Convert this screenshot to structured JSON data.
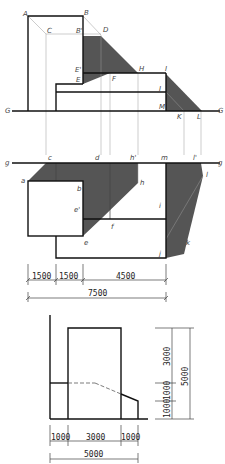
{
  "colors": {
    "shadow": "#555555",
    "line": "#111111",
    "projector": "#999999",
    "background": "#ffffff"
  },
  "elevation": {
    "ground_line_label_left": "G",
    "ground_line_label_right": "G",
    "points": {
      "A": "A",
      "B": "B",
      "C": "C",
      "B_prime": "B'",
      "D": "D",
      "E_prime": "E'",
      "E": "E",
      "F": "F",
      "H": "H",
      "I": "I",
      "J": "J",
      "M": "M",
      "K": "K",
      "L": "L"
    }
  },
  "plan": {
    "ground_line_label_left": "g",
    "ground_line_label_right": "g",
    "points": {
      "c": "c",
      "d": "d",
      "h_prime": "h'",
      "m": "m",
      "l_prime": "l'",
      "a": "a",
      "b": "b",
      "h": "h",
      "l": "l",
      "e_prime": "e'",
      "f": "f",
      "i": "i",
      "e": "e",
      "j": "j",
      "k": "k"
    }
  },
  "plan_dimensions": {
    "segments": [
      "1500",
      "1500",
      "4500"
    ],
    "total": "7500"
  },
  "side_view": {
    "horizontal_segments": [
      "1000",
      "3000",
      "1000"
    ],
    "horizontal_total": "5000",
    "vertical_segments": [
      "3000",
      "1000",
      "1000"
    ],
    "vertical_total": "5000"
  }
}
